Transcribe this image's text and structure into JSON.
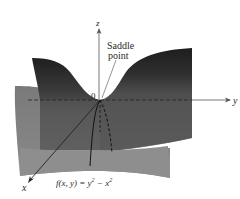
{
  "figure": {
    "function_label": "f(x, y) = y² − x²",
    "function_parts": {
      "prefix": "f(x, y) = y",
      "exp1": "2",
      "mid": " − x",
      "exp2": "2"
    },
    "annotation": {
      "line1": "Saddle",
      "line2": "point"
    },
    "origin_label": "0",
    "axes": {
      "x": "x",
      "y": "y",
      "z": "z"
    },
    "colors": {
      "surface_dark": "#2b2b2b",
      "surface_mid": "#555555",
      "surface_light": "#8a8a8a",
      "surface_front": "#9a9a9a",
      "axis": "#3a3a3a"
    }
  }
}
